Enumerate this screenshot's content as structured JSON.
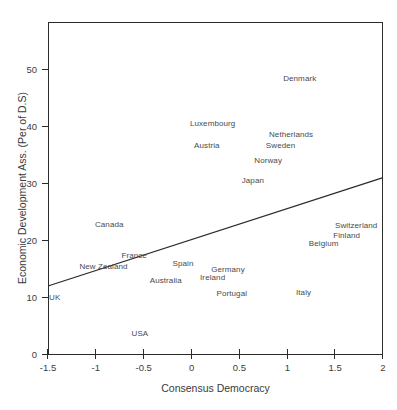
{
  "chart_data": {
    "type": "scatter",
    "title": "",
    "xlabel": "Consensus Democracy",
    "ylabel": "Economic Development Ass. (Per of D.S)",
    "xlim": [
      -1.5,
      2
    ],
    "ylim": [
      0,
      58.4
    ],
    "grid": false,
    "legend": null,
    "xticks": [
      -1.5,
      -1,
      -0.5,
      0,
      0.5,
      1,
      1.5,
      2
    ],
    "xtick_labels": [
      "-1.5",
      "-1",
      "-0.5",
      "0",
      "0.5",
      "1",
      "1.5",
      "2"
    ],
    "yticks": [
      0,
      10,
      20,
      30,
      40,
      50
    ],
    "ytick_labels": [
      "0",
      "10",
      "20",
      "30",
      "40",
      "50"
    ],
    "point_label_mode": "text-only",
    "points": [
      {
        "label": "Denmark",
        "x": 1.13,
        "y": 48.6
      },
      {
        "label": "Luxembourg",
        "x": 0.22,
        "y": 40.7
      },
      {
        "label": "Netherlands",
        "x": 1.04,
        "y": 38.8
      },
      {
        "label": "Sweden",
        "x": 0.93,
        "y": 36.8
      },
      {
        "label": "Austria",
        "x": 0.16,
        "y": 36.8
      },
      {
        "label": "Norway",
        "x": 0.8,
        "y": 34.2
      },
      {
        "label": "Japan",
        "x": 0.64,
        "y": 30.7
      },
      {
        "label": "Switzerland",
        "x": 1.72,
        "y": 22.8
      },
      {
        "label": "Canada",
        "x": -0.86,
        "y": 23.0
      },
      {
        "label": "Finland",
        "x": 1.62,
        "y": 21.1
      },
      {
        "label": "Belgium",
        "x": 1.38,
        "y": 19.6
      },
      {
        "label": "France",
        "x": -0.6,
        "y": 17.5
      },
      {
        "label": "Spain",
        "x": -0.09,
        "y": 16.1
      },
      {
        "label": "New Zealand",
        "x": -0.92,
        "y": 15.6
      },
      {
        "label": "Germany",
        "x": 0.38,
        "y": 15.1
      },
      {
        "label": "Ireland",
        "x": 0.22,
        "y": 13.7
      },
      {
        "label": "Australia",
        "x": -0.27,
        "y": 13.2
      },
      {
        "label": "Portugal",
        "x": 0.42,
        "y": 10.9
      },
      {
        "label": "Italy",
        "x": 1.17,
        "y": 11.1
      },
      {
        "label": "UK",
        "x": -1.43,
        "y": 10.2
      },
      {
        "label": "USA",
        "x": -0.54,
        "y": 3.9
      }
    ],
    "trend_line": {
      "type": "linear-fit",
      "x_start": -1.5,
      "y_start": 12.1,
      "x_end": 2,
      "y_end": 31.1,
      "color": "#2b2b2b"
    }
  },
  "colors": {
    "axis": "#2b2b2b",
    "text": "#3a3a3a",
    "label_text": "#4a4a4a",
    "background": "#ffffff"
  }
}
